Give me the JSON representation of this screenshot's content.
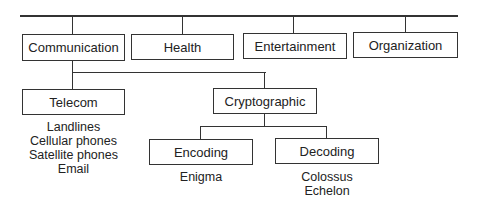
{
  "diagram": {
    "type": "hierarchy",
    "root_children": [
      {
        "label": "Communication"
      },
      {
        "label": "Health"
      },
      {
        "label": "Entertainment"
      },
      {
        "label": "Organization"
      }
    ],
    "communication_children": {
      "telecom": {
        "label": "Telecom",
        "items": [
          "Landlines",
          "Cellular phones",
          "Satellite phones",
          "Email"
        ]
      },
      "cryptographic": {
        "label": "Cryptographic",
        "children": {
          "encoding": {
            "label": "Encoding",
            "items": [
              "Enigma"
            ]
          },
          "decoding": {
            "label": "Decoding",
            "items": [
              "Colossus",
              "Echelon"
            ]
          }
        }
      }
    }
  }
}
